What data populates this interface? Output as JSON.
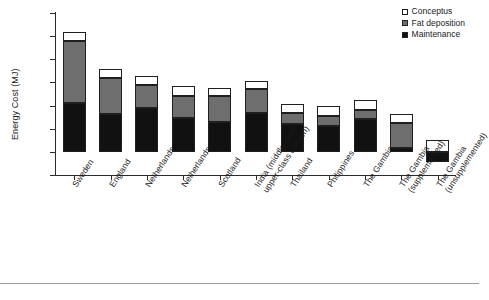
{
  "chart_data": {
    "type": "bar",
    "stacked": true,
    "title": "",
    "xlabel": "",
    "ylabel": "Energy Cost (MJ)",
    "ylim": [
      -100,
      600
    ],
    "yticks": [
      -100,
      0,
      100,
      200,
      300,
      400,
      500,
      600
    ],
    "ytick_labels": [
      "-100",
      "0",
      "100",
      "200",
      "300",
      "400",
      "500",
      "600"
    ],
    "grid": false,
    "legend_position": "top-right",
    "legend": [
      "Conceptus",
      "Fat deposition",
      "Maintenance"
    ],
    "series": [
      {
        "name": "Maintenance",
        "color": "#111111",
        "values": [
          210,
          162,
          190,
          145,
          130,
          170,
          120,
          110,
          140,
          15,
          -45
        ]
      },
      {
        "name": "Fat deposition",
        "color": "#6e6e6e",
        "values": [
          270,
          158,
          98,
          98,
          110,
          100,
          50,
          45,
          40,
          110,
          0
        ]
      },
      {
        "name": "Conceptus",
        "color": "#ffffff",
        "values": [
          40,
          40,
          40,
          40,
          38,
          35,
          38,
          42,
          42,
          40,
          50
        ]
      }
    ],
    "categories": [
      "Sweden",
      "England",
      "Netherlands",
      "Netherlands",
      "Scotland",
      "India (middle- and upper-class women)",
      "Thailand",
      "Philippines",
      "The Gambia",
      "The Gambia (supplemented)",
      "The Gambia (unsupplemented)"
    ],
    "category_lines": [
      [
        "Sweden"
      ],
      [
        "England"
      ],
      [
        "Netherlands"
      ],
      [
        "Netherlands"
      ],
      [
        "Scotland"
      ],
      [
        "India (middle- and",
        "upper-class women)"
      ],
      [
        "Thailand"
      ],
      [
        "Philippines"
      ],
      [
        "The Gambia"
      ],
      [
        "The Gambia",
        "(supplemented)"
      ],
      [
        "The Gambia",
        "(unsupplemented)"
      ]
    ],
    "totals": [
      520,
      360,
      328,
      283,
      278,
      305,
      208,
      197,
      222,
      165,
      50
    ]
  }
}
